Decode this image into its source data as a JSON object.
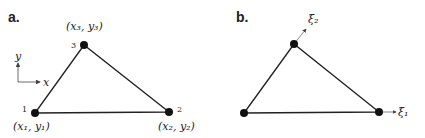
{
  "panels": [
    {
      "label": "a.",
      "axes": {
        "x_label": "x",
        "y_label": "y"
      },
      "nodes": [
        {
          "id": "1",
          "number": "1",
          "coord": "(x₁, y₁)"
        },
        {
          "id": "2",
          "number": "2",
          "coord": "(x₂, y₂)"
        },
        {
          "id": "3",
          "number": "3",
          "coord": "(x₃, y₃)"
        }
      ]
    },
    {
      "label": "b.",
      "axes": {
        "xi1_label": "ξ₁",
        "xi2_label": "ξ₂"
      }
    }
  ],
  "colors": {
    "stroke": "#222222",
    "node": "#111111",
    "axis": "#444444"
  }
}
